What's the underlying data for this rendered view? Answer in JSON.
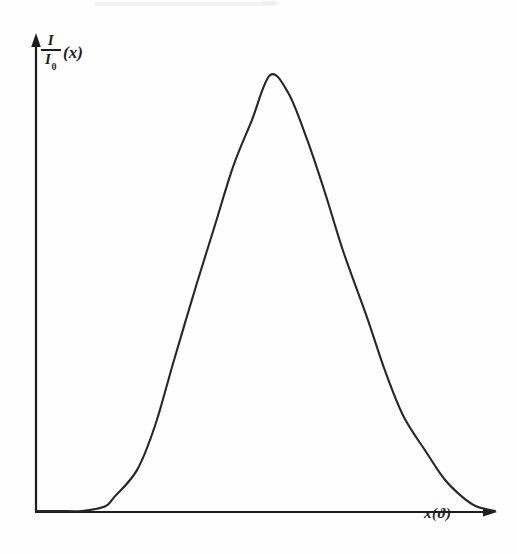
{
  "figure": {
    "kind": "hand-drawn-plot",
    "background_color": "#fefefe",
    "ink_color": "#1d1d1d"
  },
  "axes": {
    "y": {
      "label_numerator": "I",
      "label_denominator_base": "I",
      "label_denominator_sub": "0",
      "label_argument": "(x)",
      "arrow": "up-arrowhead-icon"
    },
    "x": {
      "label": "x(ϑ)",
      "arrow": "right-arrowhead-icon"
    }
  },
  "chart_data": {
    "type": "line",
    "title": "",
    "xlabel": "x(ϑ)",
    "ylabel": "I/I₀(x)",
    "grid": false,
    "legend": null,
    "axis_style": "arrow-axes-no-ticks",
    "xlim": [
      0,
      1
    ],
    "ylim": [
      0,
      1
    ],
    "x_tick_labels": [],
    "y_tick_labels": [],
    "series": [
      {
        "name": "normalized intensity",
        "x": [
          0.0,
          0.05,
          0.1,
          0.15,
          0.17,
          0.22,
          0.26,
          0.3,
          0.35,
          0.39,
          0.43,
          0.47,
          0.51,
          0.55,
          0.59,
          0.63,
          0.67,
          0.72,
          0.76,
          0.8,
          0.85,
          0.89,
          0.93,
          0.96,
          1.0
        ],
        "y": [
          0.0,
          0.0,
          0.0,
          0.01,
          0.03,
          0.09,
          0.19,
          0.33,
          0.5,
          0.63,
          0.76,
          0.86,
          0.96,
          0.92,
          0.82,
          0.7,
          0.57,
          0.43,
          0.31,
          0.21,
          0.13,
          0.07,
          0.03,
          0.01,
          0.0
        ]
      }
    ]
  }
}
